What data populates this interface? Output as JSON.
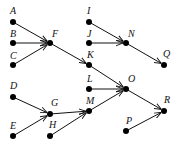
{
  "diagram": {
    "type": "directed-graph",
    "nodes": [
      {
        "id": "A",
        "label": "A",
        "x": 13,
        "y": 22,
        "lx": 10,
        "ly": 14
      },
      {
        "id": "B",
        "label": "B",
        "x": 13,
        "y": 43,
        "lx": 10,
        "ly": 37
      },
      {
        "id": "C",
        "label": "C",
        "x": 13,
        "y": 65,
        "lx": 10,
        "ly": 59
      },
      {
        "id": "F",
        "label": "F",
        "x": 50,
        "y": 43,
        "lx": 52,
        "ly": 37
      },
      {
        "id": "D",
        "label": "D",
        "x": 13,
        "y": 97,
        "lx": 10,
        "ly": 89
      },
      {
        "id": "E",
        "label": "E",
        "x": 13,
        "y": 136,
        "lx": 10,
        "ly": 129
      },
      {
        "id": "G",
        "label": "G",
        "x": 50,
        "y": 114,
        "lx": 51,
        "ly": 106
      },
      {
        "id": "H",
        "label": "H",
        "x": 50,
        "y": 136,
        "lx": 49,
        "ly": 128
      },
      {
        "id": "I",
        "label": "I",
        "x": 89,
        "y": 22,
        "lx": 87,
        "ly": 14
      },
      {
        "id": "J",
        "label": "J",
        "x": 89,
        "y": 43,
        "lx": 87,
        "ly": 37
      },
      {
        "id": "K",
        "label": "K",
        "x": 89,
        "y": 65,
        "lx": 87,
        "ly": 58
      },
      {
        "id": "N",
        "label": "N",
        "x": 126,
        "y": 43,
        "lx": 128,
        "ly": 37
      },
      {
        "id": "Q",
        "label": "Q",
        "x": 164,
        "y": 65,
        "lx": 163,
        "ly": 57
      },
      {
        "id": "L",
        "label": "L",
        "x": 89,
        "y": 89,
        "lx": 87,
        "ly": 82
      },
      {
        "id": "M",
        "label": "M",
        "x": 89,
        "y": 111,
        "lx": 86,
        "ly": 104
      },
      {
        "id": "O",
        "label": "O",
        "x": 126,
        "y": 89,
        "lx": 128,
        "ly": 82
      },
      {
        "id": "R",
        "label": "R",
        "x": 164,
        "y": 111,
        "lx": 164,
        "ly": 103
      },
      {
        "id": "P",
        "label": "P",
        "x": 126,
        "y": 131,
        "lx": 126,
        "ly": 124
      }
    ],
    "edges": [
      {
        "from": "A",
        "to": "F"
      },
      {
        "from": "B",
        "to": "F"
      },
      {
        "from": "C",
        "to": "F"
      },
      {
        "from": "F",
        "to": "K"
      },
      {
        "from": "I",
        "to": "N"
      },
      {
        "from": "J",
        "to": "N"
      },
      {
        "from": "N",
        "to": "Q"
      },
      {
        "from": "K",
        "to": "O"
      },
      {
        "from": "L",
        "to": "O"
      },
      {
        "from": "M",
        "to": "O"
      },
      {
        "from": "O",
        "to": "R"
      },
      {
        "from": "P",
        "to": "R"
      },
      {
        "from": "D",
        "to": "G"
      },
      {
        "from": "E",
        "to": "G"
      },
      {
        "from": "G",
        "to": "M"
      },
      {
        "from": "H",
        "to": "M"
      }
    ]
  }
}
